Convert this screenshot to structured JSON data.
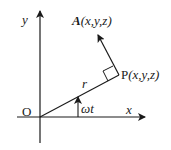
{
  "diagram": {
    "type": "vector-diagram",
    "axes": {
      "x_label": "x",
      "y_label": "y",
      "origin_label": "O"
    },
    "points": {
      "P": {
        "name": "P",
        "args": "(x,y,z)"
      },
      "A": {
        "name": "A",
        "args": "(x,y,z)"
      }
    },
    "labels": {
      "radius": "r",
      "angle": "ωt"
    },
    "colors": {
      "stroke": "#1a1a1a",
      "background": "#ffffff"
    }
  }
}
